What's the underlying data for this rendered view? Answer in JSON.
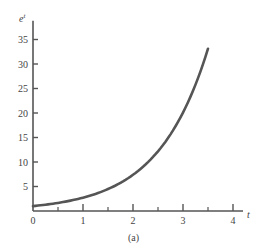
{
  "chart_data": {
    "type": "line",
    "title": "",
    "caption": "(a)",
    "xlabel": "t",
    "ylabel": "e^t",
    "ylabel_base": "e",
    "ylabel_sup": "t",
    "xlim": [
      0,
      4.2
    ],
    "ylim": [
      0,
      38
    ],
    "x_ticks": [
      0,
      1,
      2,
      3,
      4
    ],
    "x_minor_ticks": [
      0.5,
      1.5,
      2.5,
      3.5
    ],
    "y_ticks": [
      5,
      10,
      15,
      20,
      25,
      30,
      35
    ],
    "grid": false,
    "legend": null,
    "series": [
      {
        "name": "e^t",
        "function": "exp(t)",
        "x": [
          0,
          0.5,
          1,
          1.5,
          2,
          2.5,
          3,
          3.25,
          3.5
        ],
        "y": [
          1,
          1.65,
          2.72,
          4.48,
          7.39,
          12.18,
          20.09,
          25.79,
          33.12
        ],
        "color": "#555555"
      }
    ]
  }
}
